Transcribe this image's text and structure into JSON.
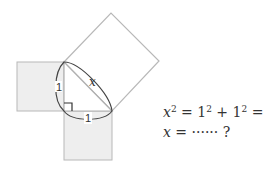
{
  "diagram": {
    "leg_a_label": "1",
    "leg_b_label": "1",
    "hypotenuse_label": "x",
    "right_angle_marker": true,
    "colors": {
      "square_fill": "#eeeeee",
      "square_stroke": "#b8b8b8",
      "hyp_square_fill": "#ffffff",
      "line": "#555555",
      "text": "#333333"
    }
  },
  "equations": {
    "line1": {
      "var": "x",
      "exp": "2",
      "rest_a": " = 1",
      "exp_a": "2",
      "rest_b": " + 1",
      "exp_b": "2",
      "rest_c": " = 2"
    },
    "line2": {
      "var": "x",
      "rest": " = ······ ?"
    }
  }
}
